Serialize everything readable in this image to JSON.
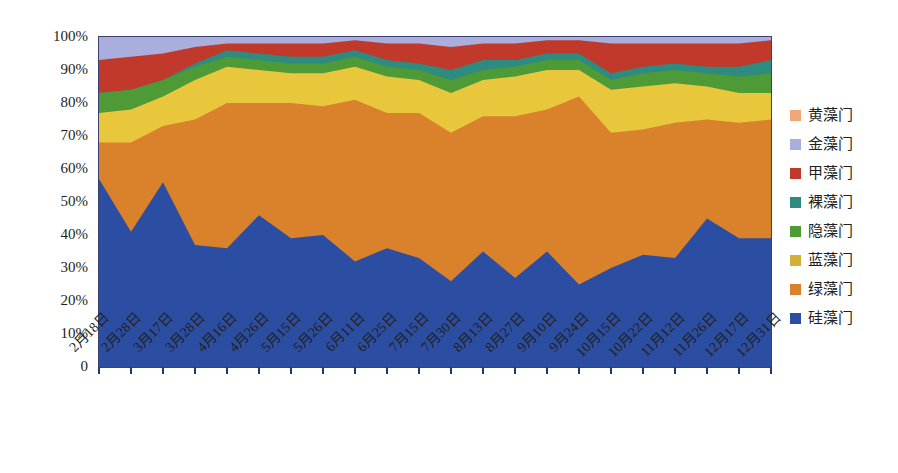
{
  "chart_data": {
    "type": "area",
    "stacked": true,
    "title": "",
    "subtitle": "",
    "xlabel": "",
    "ylabel": "",
    "ylim": [
      0,
      100
    ],
    "y_tick_labels": [
      "100%",
      "90%",
      "80%",
      "70%",
      "60%",
      "50%",
      "40%",
      "30%",
      "20%",
      "10%",
      "0"
    ],
    "y_tick_values": [
      100,
      90,
      80,
      70,
      60,
      50,
      40,
      30,
      20,
      10,
      0
    ],
    "grid": false,
    "legend_position": "right",
    "categories": [
      "2月18日",
      "2月28日",
      "3月17日",
      "3月28日",
      "4月16日",
      "4月26日",
      "5月15日",
      "5月26日",
      "6月11日",
      "6月25日",
      "7月15日",
      "7月30日",
      "8月13日",
      "8月27日",
      "9月10日",
      "9月24日",
      "10月15日",
      "10月22日",
      "11月12日",
      "11月26日",
      "12月17日",
      "12月31日"
    ],
    "series": [
      {
        "name": "硅藻门",
        "color": "#2b4ea2",
        "values": [
          57,
          41,
          56,
          37,
          36,
          46,
          39,
          40,
          32,
          36,
          33,
          26,
          35,
          27,
          35,
          25,
          30,
          34,
          33,
          45,
          39,
          39
        ]
      },
      {
        "name": "绿藻门",
        "color": "#d9822b",
        "values": [
          11,
          27,
          17,
          38,
          44,
          34,
          41,
          39,
          49,
          41,
          44,
          45,
          41,
          49,
          43,
          57,
          41,
          38,
          41,
          30,
          35,
          36
        ]
      },
      {
        "name": "蓝藻门",
        "color": "#e8c73c",
        "values": [
          9,
          10,
          9,
          12,
          11,
          10,
          9,
          10,
          10,
          11,
          10,
          12,
          11,
          12,
          12,
          8,
          13,
          13,
          12,
          10,
          9,
          8
        ]
      },
      {
        "name": "隐藻门",
        "color": "#4d9a36",
        "values": [
          6,
          6,
          5,
          4,
          3,
          3,
          3,
          3,
          3,
          3,
          3,
          4,
          3,
          3,
          3,
          3,
          3,
          4,
          4,
          4,
          5,
          6
        ]
      },
      {
        "name": "裸藻门",
        "color": "#2e8b7f",
        "values": [
          0,
          0,
          0,
          1,
          2,
          2,
          2,
          2,
          2,
          2,
          2,
          3,
          3,
          2,
          2,
          2,
          2,
          2,
          2,
          2,
          3,
          4
        ]
      },
      {
        "name": "甲藻门",
        "color": "#c0392b",
        "values": [
          10,
          10,
          8,
          5,
          2,
          3,
          4,
          4,
          3,
          5,
          6,
          7,
          5,
          5,
          4,
          4,
          9,
          7,
          6,
          7,
          7,
          6
        ]
      },
      {
        "name": "金藻门",
        "color": "#a9aedc",
        "values": [
          7,
          6,
          5,
          3,
          2,
          2,
          2,
          2,
          1,
          2,
          2,
          3,
          2,
          2,
          1,
          1,
          2,
          2,
          2,
          2,
          2,
          1
        ]
      },
      {
        "name": "黄藻门",
        "color": "#f0a878",
        "values": [
          0,
          0,
          0,
          0,
          0,
          0,
          0,
          0,
          0,
          0,
          0,
          0,
          0,
          0,
          0,
          0,
          0,
          0,
          0,
          0,
          0,
          0
        ]
      }
    ]
  },
  "legend": {
    "items": [
      {
        "label": "黄藻门",
        "color": "#f0a878"
      },
      {
        "label": "金藻门",
        "color": "#a9aedc"
      },
      {
        "label": "甲藻门",
        "color": "#c0392b"
      },
      {
        "label": "裸藻门",
        "color": "#2e8b7f"
      },
      {
        "label": "隐藻门",
        "color": "#4d9a36"
      },
      {
        "label": "蓝藻门",
        "color": "#d4af37"
      },
      {
        "label": "绿藻门",
        "color": "#d9822b"
      },
      {
        "label": "硅藻门",
        "color": "#2b4ea2"
      }
    ]
  },
  "colors": {
    "axis": "#2e3566",
    "text": "#231f20",
    "background": "#ffffff"
  }
}
